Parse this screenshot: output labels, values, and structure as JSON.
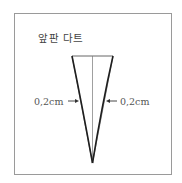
{
  "diagram": {
    "title": "앞판 다트",
    "labels": {
      "left": "0,2cm",
      "right": "0,2cm"
    },
    "arrows": {
      "left": "→",
      "right": "←"
    },
    "colors": {
      "frame": "#9a9a9a",
      "dart_outline": "#222222",
      "fold_line": "#777777",
      "text": "#444444"
    }
  }
}
